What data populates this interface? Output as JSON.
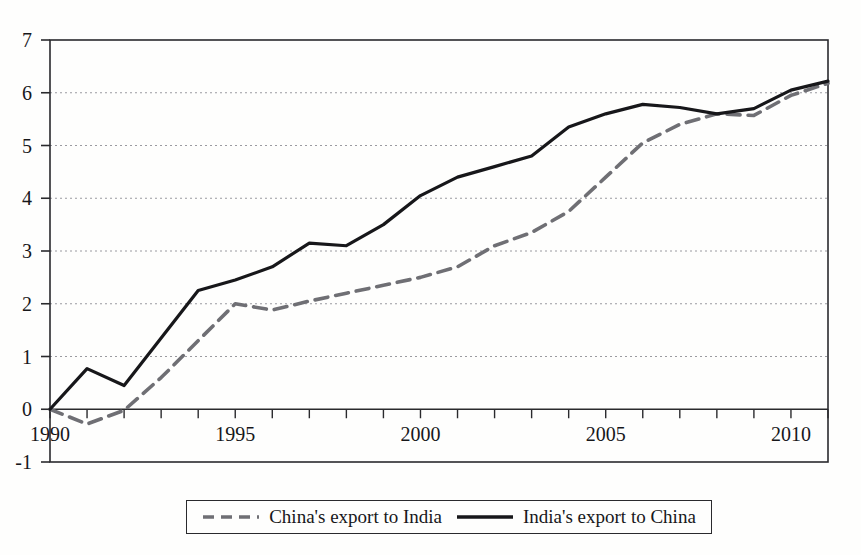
{
  "chart_data": {
    "type": "line",
    "title": "",
    "subtitle": "",
    "xlabel": "",
    "ylabel": "",
    "xlim": [
      1990,
      2011
    ],
    "ylim": [
      -1,
      7
    ],
    "grid": "horizontal-dotted",
    "legend_position": "bottom-outside",
    "x": [
      1990,
      1991,
      1992,
      1993,
      1994,
      1995,
      1996,
      1997,
      1998,
      1999,
      2000,
      2001,
      2002,
      2003,
      2004,
      2005,
      2006,
      2007,
      2008,
      2009,
      2010,
      2011
    ],
    "y_ticks": [
      -1,
      0,
      1,
      2,
      3,
      4,
      5,
      6,
      7
    ],
    "y_tick_labels": [
      "-1",
      "0",
      "1",
      "2",
      "3",
      "4",
      "5",
      "6",
      "7"
    ],
    "x_ticks": [
      1990,
      1991,
      1992,
      1993,
      1994,
      1995,
      1996,
      1997,
      1998,
      1999,
      2000,
      2001,
      2002,
      2003,
      2004,
      2005,
      2006,
      2007,
      2008,
      2009,
      2010,
      2011
    ],
    "x_tick_labels_shown": [
      "1990",
      "1995",
      "2000",
      "2005",
      "2010"
    ],
    "x_tick_label_positions": [
      1990,
      1995,
      2000,
      2005,
      2010
    ],
    "series": [
      {
        "name": "China's export to India",
        "style": "dashed",
        "color": "#6f6f74",
        "values": [
          0.0,
          -0.28,
          -0.02,
          0.6,
          1.3,
          2.0,
          1.88,
          2.05,
          2.2,
          2.35,
          2.5,
          2.7,
          3.1,
          3.35,
          3.75,
          4.4,
          5.05,
          5.4,
          5.6,
          5.57,
          5.95,
          6.18
        ]
      },
      {
        "name": "India's export to China",
        "style": "solid",
        "color": "#17171a",
        "values": [
          0.0,
          0.77,
          0.45,
          1.35,
          2.25,
          2.45,
          2.7,
          3.15,
          3.1,
          3.5,
          4.05,
          4.4,
          4.6,
          4.8,
          5.35,
          5.6,
          5.78,
          5.72,
          5.6,
          5.7,
          6.05,
          6.22
        ]
      }
    ]
  },
  "legend": {
    "entries": [
      {
        "label": "China's export to India",
        "style": "dashed"
      },
      {
        "label": "India's export to China",
        "style": "solid"
      }
    ]
  },
  "colors": {
    "background": "#fefefd",
    "axis": "#2a2a2d",
    "gridline": "#9a9aa0",
    "solid_series": "#17171a",
    "dashed_series": "#6f6f74",
    "text": "#17171a"
  }
}
